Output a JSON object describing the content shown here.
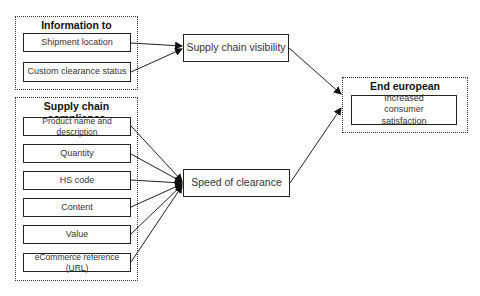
{
  "groups": {
    "info": {
      "title": "Information to consumer",
      "items": [
        "Shipment location",
        "Custom clearance status"
      ]
    },
    "compliance": {
      "title": "Supply chain compliance",
      "items": [
        "Product name and description",
        "Quantity",
        "HS code",
        "Content",
        "Value",
        "eCommerce reference (URL)"
      ]
    },
    "end": {
      "title": "End european consumers",
      "items": [
        "Increased consumer satisfaction"
      ]
    }
  },
  "nodes": {
    "visibility": "Supply chain visibility",
    "speed": "Speed of clearance"
  },
  "edges": [
    {
      "from": "Shipment location",
      "to": "Supply chain visibility"
    },
    {
      "from": "Custom clearance status",
      "to": "Supply chain visibility"
    },
    {
      "from": "Product name and description",
      "to": "Speed of clearance"
    },
    {
      "from": "Quantity",
      "to": "Speed of clearance"
    },
    {
      "from": "HS code",
      "to": "Speed of clearance"
    },
    {
      "from": "Content",
      "to": "Speed of clearance"
    },
    {
      "from": "Value",
      "to": "Speed of clearance"
    },
    {
      "from": "eCommerce reference (URL)",
      "to": "Speed of clearance"
    },
    {
      "from": "Supply chain visibility",
      "to": "End european consumers"
    },
    {
      "from": "Speed of clearance",
      "to": "End european consumers"
    }
  ]
}
